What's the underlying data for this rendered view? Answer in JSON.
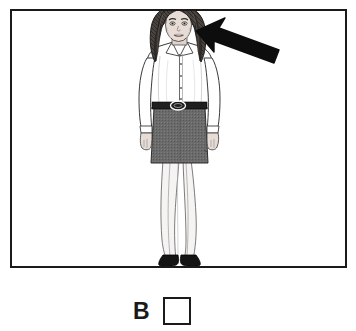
{
  "scene": {
    "type": "illustration-with-pointer",
    "description": "Line-art illustration of a standing woman in business attire with a bold black arrow pointing at her head",
    "frame": {
      "border_color": "#1a1a1a",
      "background_color": "#ffffff",
      "x": 10,
      "y": 9,
      "width": 337,
      "height": 259
    },
    "subject": {
      "name": "standing-woman",
      "hair": {
        "style": "long",
        "color": "#3a3a3a"
      },
      "top": {
        "garment": "blouse",
        "color": "#ffffff",
        "detail": "collar and button placket"
      },
      "belt": {
        "color": "#1f1f1f",
        "buckle": "oval"
      },
      "bottom": {
        "garment": "skirt",
        "color": "#6b6b6b",
        "length": "knee"
      },
      "legs": {
        "hosiery": "light",
        "color": "#f2f0ee"
      },
      "shoes": {
        "color": "#121212",
        "style": "flats"
      },
      "skin_color": "#e8ddd6"
    },
    "pointer": {
      "name": "arrow",
      "color": "#0d0d0d",
      "direction": "up-left",
      "tip_x": 196,
      "tip_y": 31,
      "tail_x": 279,
      "tail_y": 63,
      "points_at": "head"
    }
  },
  "answer": {
    "letter": "B",
    "checkbox_checked": false,
    "checkbox_border_color": "#1a1a1a",
    "checkbox_fill_color": "#ffffff"
  }
}
